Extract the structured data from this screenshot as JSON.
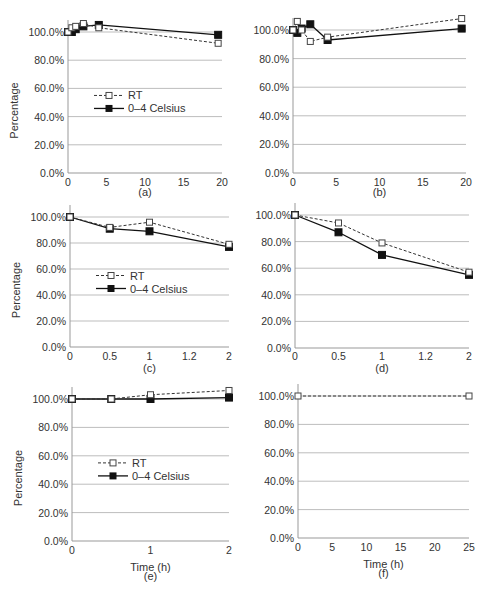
{
  "figure": {
    "y_label": "Percentage",
    "x_label": "Time (h)",
    "legend": {
      "rt": "RT",
      "cold": "0–4 Celsius"
    },
    "colors": {
      "rt_line": "#333333",
      "cold_line": "#111111",
      "grid": "#bdbdbd",
      "axis": "#999999"
    }
  },
  "chart_data": [
    {
      "panel": "(a)",
      "type": "line",
      "x_ticks": [
        "0",
        "5",
        "10",
        "15",
        "20"
      ],
      "xlim": [
        0,
        20
      ],
      "y_ticks": [
        "0.0%",
        "20.0%",
        "40.0%",
        "60.0%",
        "80.0%",
        "100.0%"
      ],
      "ylim": [
        0,
        110
      ],
      "ylabel": "Percentage",
      "xlabel": "",
      "legend": true,
      "grid": "horizontal",
      "series": [
        {
          "name": "RT",
          "style": "dashed-open-square",
          "x": [
            0,
            0.5,
            1,
            2,
            4,
            19.5
          ],
          "y": [
            100,
            103,
            104,
            106,
            103,
            92
          ]
        },
        {
          "name": "0–4 Celsius",
          "style": "solid-filled-square",
          "x": [
            0,
            0.5,
            1,
            2,
            4,
            19.5
          ],
          "y": [
            100,
            100,
            102,
            104,
            105,
            98
          ]
        }
      ]
    },
    {
      "panel": "(b)",
      "type": "line",
      "x_ticks": [
        "0",
        "5",
        "10",
        "15",
        "20"
      ],
      "xlim": [
        0,
        20
      ],
      "y_ticks": [
        "0.0%",
        "20.0%",
        "40.0%",
        "60.0%",
        "80.0%",
        "100.0%"
      ],
      "ylim": [
        0,
        110
      ],
      "ylabel": "",
      "xlabel": "",
      "legend": false,
      "grid": "horizontal",
      "series": [
        {
          "name": "RT",
          "style": "dashed-open-square",
          "x": [
            0,
            0.5,
            1,
            2,
            4,
            19.5
          ],
          "y": [
            100,
            106,
            100,
            92,
            95,
            108
          ]
        },
        {
          "name": "0–4 Celsius",
          "style": "solid-filled-square",
          "x": [
            0,
            0.5,
            1,
            2,
            4,
            19.5
          ],
          "y": [
            100,
            98,
            101,
            104,
            93,
            101
          ]
        }
      ]
    },
    {
      "panel": "(c)",
      "type": "line",
      "x_ticks": [
        "0",
        "0.5",
        "1",
        "1.2",
        "2"
      ],
      "xlim": [
        0,
        2
      ],
      "y_ticks": [
        "0.0%",
        "20.0%",
        "40.0%",
        "60.0%",
        "80.0%",
        "100.0%"
      ],
      "ylim": [
        0,
        105
      ],
      "ylabel": "Percentage",
      "xlabel": "",
      "legend": true,
      "grid": "horizontal",
      "series": [
        {
          "name": "RT",
          "style": "dashed-open-square",
          "x_index": [
            0,
            1,
            2,
            4
          ],
          "y": [
            100,
            92,
            96,
            79
          ]
        },
        {
          "name": "0–4 Celsius",
          "style": "solid-filled-square",
          "x_index": [
            0,
            1,
            2,
            4
          ],
          "y": [
            100,
            91,
            89,
            77
          ]
        }
      ]
    },
    {
      "panel": "(d)",
      "type": "line",
      "x_ticks": [
        "0",
        "0.5",
        "1",
        "1.2",
        "2"
      ],
      "xlim": [
        0,
        2
      ],
      "y_ticks": [
        "0.0%",
        "20.0%",
        "40.0%",
        "60.0%",
        "80.0%",
        "100.0%"
      ],
      "ylim": [
        0,
        105
      ],
      "ylabel": "",
      "xlabel": "",
      "legend": false,
      "grid": "horizontal",
      "series": [
        {
          "name": "RT",
          "style": "dashed-open-square",
          "x_index": [
            0,
            1,
            2,
            4
          ],
          "y": [
            100,
            94,
            79,
            57
          ]
        },
        {
          "name": "0–4 Celsius",
          "style": "solid-filled-square",
          "x_index": [
            0,
            1,
            2,
            4
          ],
          "y": [
            100,
            87,
            70,
            55
          ]
        }
      ]
    },
    {
      "panel": "(e)",
      "type": "line",
      "x_ticks": [
        "0",
        "1",
        "2"
      ],
      "xlim": [
        0,
        2
      ],
      "y_ticks": [
        "0.0%",
        "20.0%",
        "40.0%",
        "60.0%",
        "80.0%",
        "100.0%"
      ],
      "ylim": [
        0,
        110
      ],
      "ylabel": "Percentage",
      "xlabel": "Time (h)",
      "legend": true,
      "grid": "horizontal",
      "series": [
        {
          "name": "RT",
          "style": "dashed-open-square",
          "x": [
            0,
            0.5,
            1,
            2
          ],
          "y": [
            100,
            100,
            103,
            106
          ]
        },
        {
          "name": "0–4 Celsius",
          "style": "solid-filled-square",
          "x": [
            0,
            0.5,
            1,
            2
          ],
          "y": [
            100,
            100,
            100,
            101
          ]
        }
      ]
    },
    {
      "panel": "(f)",
      "type": "line",
      "x_ticks": [
        "0",
        "5",
        "10",
        "15",
        "20",
        "25"
      ],
      "xlim": [
        0,
        25
      ],
      "y_ticks": [
        "0.0%",
        "20.0%",
        "40.0%",
        "60.0%",
        "80.0%",
        "100.0%"
      ],
      "ylim": [
        0,
        100
      ],
      "ylabel": "",
      "xlabel": "Time (h)",
      "legend": false,
      "grid": "horizontal",
      "series": [
        {
          "name": "RT",
          "style": "dashed-open-square",
          "x": [
            0,
            25
          ],
          "y": [
            100,
            100
          ]
        }
      ]
    }
  ]
}
